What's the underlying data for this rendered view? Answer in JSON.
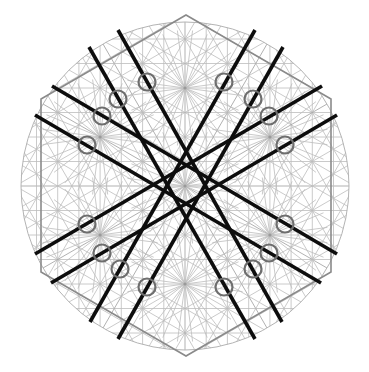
{
  "diagram": {
    "symmetry": "six-fold grid with mirror-symmetric heavy lines",
    "colors": {
      "background": "#ffffff",
      "grid": "#bdbdbd",
      "circle": "#b4b4b4",
      "hexagon": "#8a8a8a",
      "heavy_lines": "#0d0d0d",
      "rings": "#6e6e6e"
    },
    "counts": {
      "heavy_lines": 8,
      "rings": 16,
      "hexagon_sides": 6
    },
    "labels": []
  }
}
